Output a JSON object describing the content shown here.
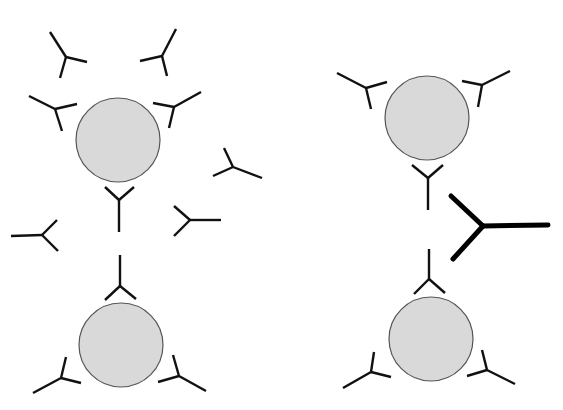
{
  "diagram": {
    "type": "schematic",
    "colors": {
      "bead_fill": "#d9d9d9",
      "bead_stroke": "#555555",
      "antibody": "#111111",
      "crosslinker": "#000000",
      "background": "#ffffff"
    },
    "panels": [
      {
        "name": "left-panel",
        "beads": [
          {
            "id": "bead-top-left",
            "cx": 118,
            "cy": 140,
            "r": 42
          },
          {
            "id": "bead-bottom-left",
            "cx": 121,
            "cy": 345,
            "r": 42
          }
        ],
        "antibodies": [
          {
            "id": "ab-1",
            "c": [
              66,
              57
            ],
            "arms": [
              [
                50,
                32
              ],
              [
                87,
                62
              ],
              [
                60,
                78
              ]
            ]
          },
          {
            "id": "ab-2",
            "c": [
              162,
              56
            ],
            "arms": [
              [
                176,
                29
              ],
              [
                140,
                61
              ],
              [
                167,
                76
              ]
            ]
          },
          {
            "id": "ab-3",
            "c": [
              55,
              109
            ],
            "arms": [
              [
                29,
                96
              ],
              [
                77,
                104
              ],
              [
                62,
                131
              ]
            ]
          },
          {
            "id": "ab-4",
            "c": [
              174,
              107
            ],
            "arms": [
              [
                201,
                92
              ],
              [
                153,
                103
              ],
              [
                169,
                128
              ]
            ]
          },
          {
            "id": "ab-5",
            "c": [
              233,
              167
            ],
            "arms": [
              [
                224,
                148
              ],
              [
                262,
                178
              ],
              [
                213,
                176
              ]
            ]
          },
          {
            "id": "ab-6",
            "c": [
              119,
              200
            ],
            "arms": [
              [
                105,
                187
              ],
              [
                134,
                187
              ],
              [
                119,
                232
              ]
            ]
          },
          {
            "id": "ab-7",
            "c": [
              42,
              235
            ],
            "arms": [
              [
                11,
                236
              ],
              [
                57,
                220
              ],
              [
                58,
                251
              ]
            ]
          },
          {
            "id": "ab-8",
            "c": [
              190,
              220
            ],
            "arms": [
              [
                221,
                220
              ],
              [
                174,
                206
              ],
              [
                174,
                236
              ]
            ]
          },
          {
            "id": "ab-9",
            "c": [
              120,
              286
            ],
            "arms": [
              [
                120,
                255
              ],
              [
                105,
                300
              ],
              [
                136,
                299
              ]
            ]
          },
          {
            "id": "ab-10",
            "c": [
              61,
              378
            ],
            "arms": [
              [
                66,
                357
              ],
              [
                81,
                383
              ],
              [
                33,
                393
              ]
            ]
          },
          {
            "id": "ab-11",
            "c": [
              179,
              376
            ],
            "arms": [
              [
                173,
                355
              ],
              [
                158,
                382
              ],
              [
                206,
                391
              ]
            ]
          }
        ]
      },
      {
        "name": "right-panel",
        "beads": [
          {
            "id": "bead-top-right",
            "cx": 427,
            "cy": 118,
            "r": 42
          },
          {
            "id": "bead-bottom-right",
            "cx": 431,
            "cy": 339,
            "r": 42
          }
        ],
        "antibodies": [
          {
            "id": "ab-12",
            "c": [
              366,
              88
            ],
            "arms": [
              [
                337,
                73
              ],
              [
                387,
                82
              ],
              [
                371,
                109
              ]
            ]
          },
          {
            "id": "ab-13",
            "c": [
              482,
              85
            ],
            "arms": [
              [
                510,
                71
              ],
              [
                462,
                81
              ],
              [
                478,
                107
              ]
            ]
          },
          {
            "id": "ab-14",
            "c": [
              428,
              178
            ],
            "arms": [
              [
                412,
                165
              ],
              [
                443,
                165
              ],
              [
                428,
                210
              ]
            ]
          },
          {
            "id": "ab-15",
            "c": [
              429,
              279
            ],
            "arms": [
              [
                429,
                249
              ],
              [
                414,
                294
              ],
              [
                445,
                293
              ]
            ]
          },
          {
            "id": "ab-16",
            "c": [
              371,
              372
            ],
            "arms": [
              [
                374,
                352
              ],
              [
                391,
                377
              ],
              [
                343,
                388
              ]
            ]
          },
          {
            "id": "ab-17",
            "c": [
              487,
              370
            ],
            "arms": [
              [
                482,
                350
              ],
              [
                467,
                376
              ],
              [
                515,
                384
              ]
            ]
          }
        ],
        "crosslinker": {
          "id": "crosslinker-antibody",
          "c": [
            483,
            226
          ],
          "arms": [
            [
              451,
              196
            ],
            [
              548,
              225
            ],
            [
              453,
              259
            ]
          ]
        }
      }
    ]
  }
}
